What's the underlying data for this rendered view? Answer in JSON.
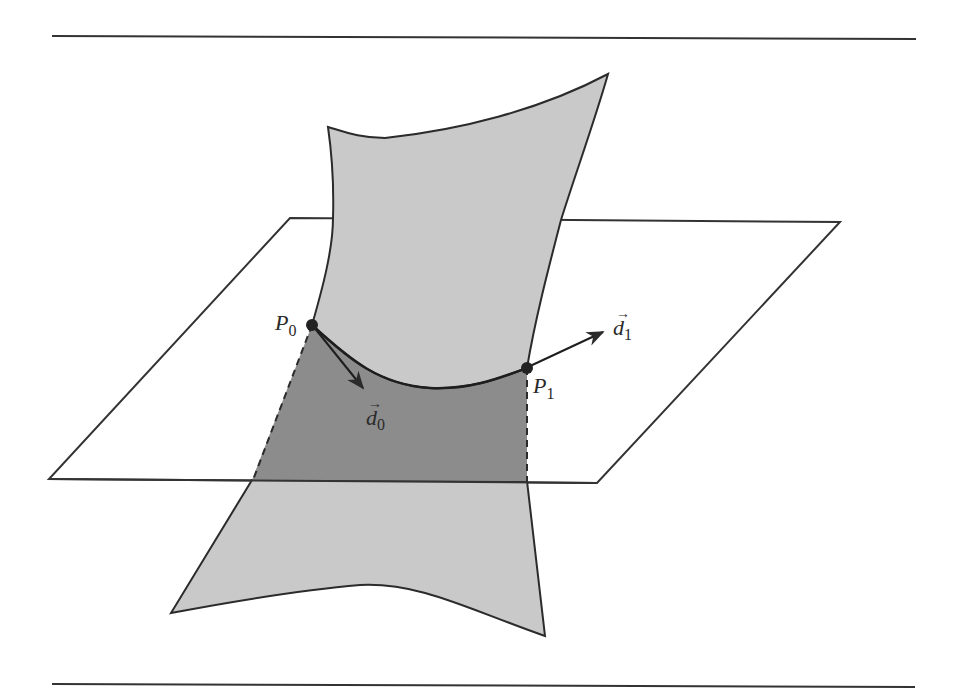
{
  "figure": {
    "type": "surface-plane-intersection",
    "colors": {
      "surface_light": "#c9c9c9",
      "surface_dark": "#8c8c8c",
      "stroke": "#2b2b2b",
      "background": "#ffffff"
    },
    "points": [
      {
        "name": "P",
        "subscript": "0"
      },
      {
        "name": "P",
        "subscript": "1"
      }
    ],
    "vectors": [
      {
        "name": "d",
        "subscript": "0",
        "arrow_accent": "→"
      },
      {
        "name": "d",
        "subscript": "1",
        "arrow_accent": "→"
      }
    ]
  }
}
